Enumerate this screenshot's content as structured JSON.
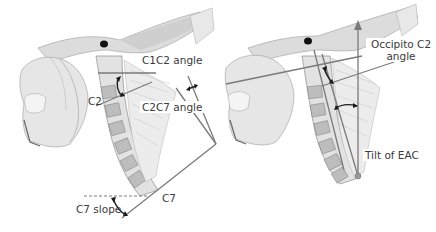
{
  "figure": {
    "colors": {
      "background": "#ffffff",
      "line": "#7a7a7a",
      "arrow": "#1a1a1a",
      "label_text": "#3a3a3a",
      "anatomy_shade": "#c9c9c9",
      "anatomy_dark": "#8c8c8c"
    },
    "left_panel": {
      "labels": {
        "c1c2_angle": "C1C2 angle",
        "c2c7_angle": "C2C7 angle",
        "c2": "C2",
        "c7": "C7",
        "c7_slope": "C7 slope"
      }
    },
    "right_panel": {
      "labels": {
        "occipito_c2_angle_line1": "Occipito C2",
        "occipito_c2_angle_line2": "angle",
        "tilt_of_eac": "Tilt of EAC"
      }
    }
  }
}
